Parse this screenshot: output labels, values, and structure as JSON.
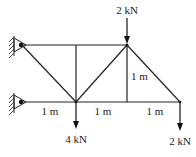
{
  "diagram": {
    "type": "truss",
    "nodes": {
      "A": {
        "x": 22,
        "y": 45,
        "support": "pin"
      },
      "B": {
        "x": 76,
        "y": 45
      },
      "C": {
        "x": 127,
        "y": 45
      },
      "D": {
        "x": 22,
        "y": 102,
        "support": "pin"
      },
      "E": {
        "x": 76,
        "y": 102
      },
      "F": {
        "x": 127,
        "y": 102
      },
      "G": {
        "x": 180,
        "y": 102
      }
    },
    "members": [
      [
        "A",
        "B"
      ],
      [
        "B",
        "C"
      ],
      [
        "D",
        "E"
      ],
      [
        "E",
        "F"
      ],
      [
        "F",
        "G"
      ],
      [
        "B",
        "E"
      ],
      [
        "C",
        "F"
      ],
      [
        "A",
        "E"
      ],
      [
        "E",
        "C"
      ],
      [
        "C",
        "G"
      ]
    ],
    "loads": [
      {
        "node": "C",
        "label": "2 kN",
        "direction": "down"
      },
      {
        "node": "E",
        "label": "4 kN",
        "direction": "down"
      },
      {
        "node": "G",
        "label": "2 kN",
        "direction": "down"
      }
    ],
    "dimensions": [
      {
        "label": "1 m",
        "position": "bottom segment D-E"
      },
      {
        "label": "1 m",
        "position": "bottom segment E-F"
      },
      {
        "label": "1 m",
        "position": "bottom segment F-G"
      },
      {
        "label": "1 m",
        "position": "vertical C-F"
      }
    ],
    "labels": {
      "load_top": "2 kN",
      "load_mid": "4 kN",
      "load_right": "2 kN",
      "dim_1": "1 m",
      "dim_2": "1 m",
      "dim_3": "1 m",
      "dim_vertical": "1 m"
    }
  }
}
